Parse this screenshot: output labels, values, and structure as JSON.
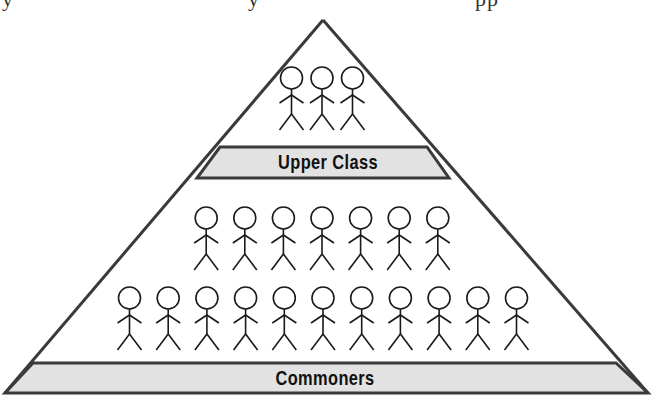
{
  "diagram": {
    "type": "social-pyramid",
    "top_cutoff_text": [
      "y",
      "y",
      "pp"
    ],
    "tiers": [
      {
        "name": "upper",
        "label": "Upper Class",
        "figure_rows": [
          3
        ]
      },
      {
        "name": "commoners",
        "label": "Commoners",
        "figure_rows": [
          7,
          11
        ]
      }
    ],
    "colors": {
      "outline": "#3a3a3a",
      "band_fill": "#e2e2e2",
      "background": "#ffffff",
      "figure_stroke": "#1a1a1a",
      "label_text": "#111111"
    }
  }
}
